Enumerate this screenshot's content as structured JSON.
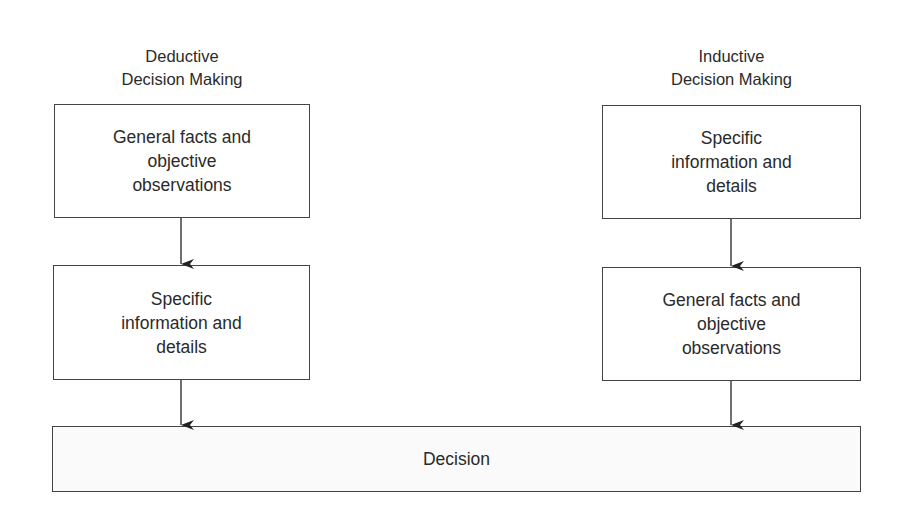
{
  "diagram": {
    "deductive": {
      "title_line1": "Deductive",
      "title_line2": "Decision Making",
      "box1": [
        "General facts and",
        "objective",
        "observations"
      ],
      "box2": [
        "Specific",
        "information and",
        "details"
      ]
    },
    "inductive": {
      "title_line1": "Inductive",
      "title_line2": "Decision Making",
      "box1": [
        "Specific",
        "information and",
        "details"
      ],
      "box2": [
        "General facts and",
        "objective",
        "observations"
      ]
    },
    "decision": {
      "label": "Decision"
    },
    "colors": {
      "line": "#444444",
      "text": "#2a2a2a",
      "background": "#ffffff"
    }
  }
}
